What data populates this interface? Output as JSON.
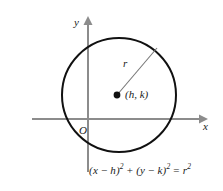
{
  "figure": {
    "type": "geometry-diagram",
    "background_color": "#ffffff"
  },
  "axes": {
    "color": "#8c8c8c",
    "origin_label": "O",
    "x_label": "x",
    "y_label": "y",
    "x_axis": {
      "start_x": 32,
      "end_x": 205,
      "y": 119
    },
    "y_axis": {
      "x": 88,
      "start_y": 18,
      "end_y": 172
    }
  },
  "circle": {
    "color": "#111111",
    "center_x": 119,
    "center_y": 95,
    "radius": 57,
    "stroke_width": 2
  },
  "center_point": {
    "label": "(h, k)",
    "dot_color": "#111111",
    "x": 117,
    "y": 95
  },
  "radius_line": {
    "label": "r",
    "color": "#777777",
    "from_x": 117,
    "from_y": 95,
    "to_x": 157,
    "to_y": 48
  },
  "equation": {
    "parts": {
      "open1": "(",
      "x_var": "x",
      "minus1": " − ",
      "h_var": "h",
      "close1": ")",
      "sup1": "2",
      "plus": " + ",
      "open2": "(",
      "y_var": "y",
      "minus2": " − ",
      "k_var": "k",
      "close2": ")",
      "sup2": "2",
      "equals": " = ",
      "r_var": "r",
      "sup3": "2"
    },
    "full_text": "(x − h)² + (y − k)² = r²"
  }
}
